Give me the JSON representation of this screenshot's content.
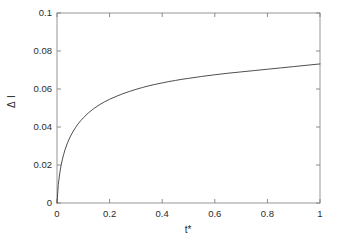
{
  "chart_data": {
    "type": "line",
    "title": "",
    "xlabel": "t*",
    "ylabel": "Δ I",
    "xlim": [
      0,
      1
    ],
    "ylim": [
      0,
      0.1
    ],
    "grid": false,
    "legend": null,
    "xticks": [
      "0",
      "0.2",
      "0.4",
      "0.6",
      "0.8",
      "1"
    ],
    "xtick_values": [
      0,
      0.2,
      0.4,
      0.6,
      0.8,
      1
    ],
    "yticks": [
      "0",
      "0.02",
      "0.04",
      "0.06",
      "0.08",
      "0.1"
    ],
    "ytick_values": [
      0,
      0.02,
      0.04,
      0.06,
      0.08,
      0.1
    ],
    "line_color": "#3a3a3a",
    "line_width": 0.9,
    "axis_color": "#808080",
    "background": "#ffffff",
    "series": [
      {
        "name": "Δ I",
        "x": [
          0.0,
          0.005,
          0.01,
          0.015,
          0.02,
          0.025,
          0.03,
          0.04,
          0.05,
          0.06,
          0.07,
          0.08,
          0.09,
          0.1,
          0.12,
          0.14,
          0.16,
          0.18,
          0.2,
          0.225,
          0.25,
          0.275,
          0.3,
          0.325,
          0.35,
          0.375,
          0.4,
          0.425,
          0.45,
          0.475,
          0.5,
          0.55,
          0.6,
          0.65,
          0.7,
          0.75,
          0.8,
          0.85,
          0.9,
          0.95,
          1.0
        ],
        "y": [
          0.0,
          0.0097,
          0.0153,
          0.0194,
          0.0227,
          0.0254,
          0.0278,
          0.0317,
          0.0348,
          0.0374,
          0.0396,
          0.0416,
          0.0433,
          0.0448,
          0.0475,
          0.0497,
          0.0516,
          0.0532,
          0.0546,
          0.0561,
          0.0575,
          0.0587,
          0.0598,
          0.0608,
          0.0617,
          0.0625,
          0.0632,
          0.0639,
          0.0645,
          0.0651,
          0.0656,
          0.0666,
          0.0675,
          0.0683,
          0.069,
          0.0697,
          0.0704,
          0.0711,
          0.0718,
          0.0725,
          0.0732
        ]
      }
    ],
    "annotations": []
  },
  "axes": {
    "left_px": 57,
    "right_px": 320,
    "top_px": 13,
    "bottom_px": 203
  }
}
